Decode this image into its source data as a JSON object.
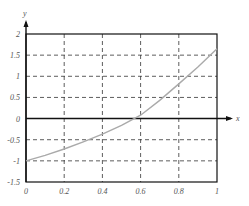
{
  "chart_data": {
    "type": "line",
    "title": "",
    "xlabel": "x",
    "ylabel": "y",
    "xlim": [
      0,
      1
    ],
    "ylim": [
      -1.5,
      2
    ],
    "grid": true,
    "x_ticks": [
      "0",
      "0.2",
      "0.4",
      "0.6",
      "0.8",
      "1"
    ],
    "y_ticks": [
      "2",
      "1.5",
      "1",
      "0.5",
      "0",
      "-0.5",
      "-1",
      "-1.5"
    ],
    "series": [
      {
        "name": "f(x)",
        "color": "#aaaaaa",
        "x": [
          0,
          0.1,
          0.2,
          0.3,
          0.4,
          0.5,
          0.6,
          0.7,
          0.8,
          0.9,
          1.0
        ],
        "y": [
          -1.0,
          -0.87,
          -0.72,
          -0.55,
          -0.37,
          -0.16,
          0.08,
          0.43,
          0.82,
          1.22,
          1.65
        ]
      }
    ]
  }
}
